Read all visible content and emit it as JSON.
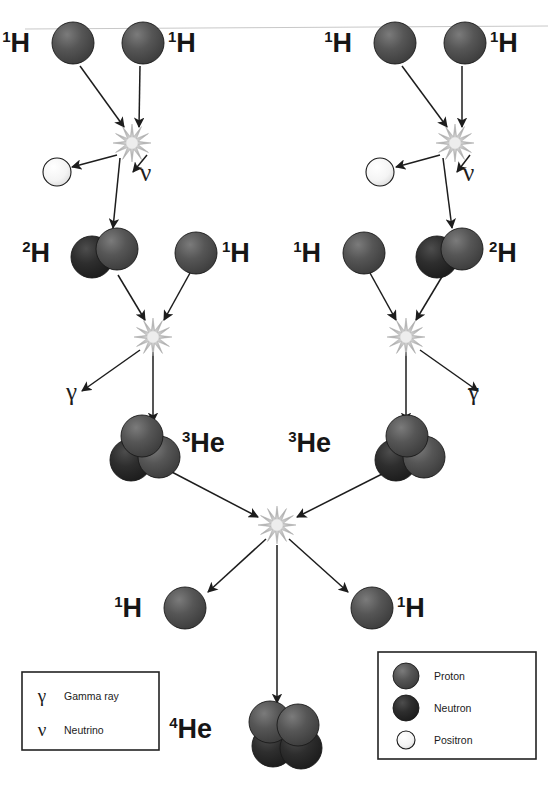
{
  "figure": {
    "background_color": "#ffffff"
  },
  "colors": {
    "proton": "#4a4a4a",
    "proton_highlight": "#6e6e6e",
    "neutron": "#262626",
    "neutron_highlight": "#454545",
    "positron": "#f2f2f2",
    "positron_highlight": "#ffffff",
    "outline": "#1a1a1a",
    "arrow": "#1d1d1d",
    "starburst": "#b9b9b9",
    "text": "#161616"
  },
  "labels": {
    "hydrogen_mass": "1",
    "hydrogen_symbol": "H",
    "deuterium_mass": "2",
    "deuterium_symbol": "H",
    "helium3_mass": "3",
    "helium3_symbol": "He",
    "helium4_mass": "4",
    "helium4_symbol": "He",
    "gamma_symbol": "γ",
    "neutrino_symbol": "ν"
  },
  "nuclei": [
    {
      "id": "h1-top-left-a",
      "label_mass": "1",
      "label_symbol": "H",
      "kind": "proton",
      "cx": 73,
      "cy": 43,
      "label_x": 30,
      "label_y": 52,
      "label_side": "left"
    },
    {
      "id": "h1-top-left-b",
      "label_mass": "1",
      "label_symbol": "H",
      "kind": "proton",
      "cx": 143,
      "cy": 43,
      "label_x": 168,
      "label_y": 52,
      "label_side": "right"
    },
    {
      "id": "h1-top-right-a",
      "label_mass": "1",
      "label_symbol": "H",
      "kind": "proton",
      "cx": 395,
      "cy": 43,
      "label_x": 352,
      "label_y": 52,
      "label_side": "left"
    },
    {
      "id": "h1-top-right-b",
      "label_mass": "1",
      "label_symbol": "H",
      "kind": "proton",
      "cx": 465,
      "cy": 43,
      "label_x": 490,
      "label_y": 52,
      "label_side": "right"
    },
    {
      "id": "d2-left",
      "label_mass": "2",
      "label_symbol": "H",
      "kind": "deuteron",
      "cx": 108,
      "cy": 253,
      "label_x": 50,
      "label_y": 262,
      "label_side": "left"
    },
    {
      "id": "h1-mid-left",
      "label_mass": "1",
      "label_symbol": "H",
      "kind": "proton",
      "cx": 196,
      "cy": 253,
      "label_x": 222,
      "label_y": 262,
      "label_side": "right"
    },
    {
      "id": "h1-mid-right",
      "label_mass": "1",
      "label_symbol": "H",
      "kind": "proton",
      "cx": 364,
      "cy": 253,
      "label_x": 321,
      "label_y": 262,
      "label_side": "left"
    },
    {
      "id": "d2-right",
      "label_mass": "2",
      "label_symbol": "H",
      "kind": "deuteron",
      "cx": 453,
      "cy": 253,
      "label_x": 489,
      "label_y": 262,
      "label_side": "right"
    },
    {
      "id": "he3-left",
      "label_mass": "3",
      "label_symbol": "He",
      "kind": "helium3",
      "cx": 145,
      "cy": 447,
      "label_x": 182,
      "label_y": 452,
      "label_side": "right"
    },
    {
      "id": "he3-right",
      "label_mass": "3",
      "label_symbol": "He",
      "kind": "helium3",
      "cx": 410,
      "cy": 447,
      "label_x": 331,
      "label_y": 452,
      "label_side": "left"
    },
    {
      "id": "h1-out-left",
      "label_mass": "1",
      "label_symbol": "H",
      "kind": "proton",
      "cx": 185,
      "cy": 608,
      "label_x": 142,
      "label_y": 617,
      "label_side": "left"
    },
    {
      "id": "h1-out-right",
      "label_mass": "1",
      "label_symbol": "H",
      "kind": "proton",
      "cx": 372,
      "cy": 608,
      "label_x": 397,
      "label_y": 617,
      "label_side": "right"
    },
    {
      "id": "he4-final",
      "label_mass": "4",
      "label_symbol": "He",
      "kind": "helium4",
      "cx": 290,
      "cy": 733,
      "label_x": 212,
      "label_y": 738,
      "label_side": "left"
    }
  ],
  "positrons": [
    {
      "id": "positron-left",
      "cx": 57,
      "cy": 172
    },
    {
      "id": "positron-right",
      "cx": 380,
      "cy": 172
    }
  ],
  "greek_labels": [
    {
      "id": "neutrino-left",
      "symbol": "ν",
      "x": 140,
      "y": 181
    },
    {
      "id": "neutrino-right",
      "symbol": "ν",
      "x": 463,
      "y": 181
    },
    {
      "id": "gamma-left",
      "symbol": "γ",
      "x": 66,
      "y": 400
    },
    {
      "id": "gamma-right",
      "symbol": "γ",
      "x": 468,
      "y": 400
    }
  ],
  "starbursts": [
    {
      "id": "fusion-1-left",
      "cx": 132,
      "cy": 143,
      "r": 19
    },
    {
      "id": "fusion-1-right",
      "cx": 455,
      "cy": 143,
      "r": 19
    },
    {
      "id": "fusion-2-left",
      "cx": 153,
      "cy": 337,
      "r": 19
    },
    {
      "id": "fusion-2-right",
      "cx": 406,
      "cy": 337,
      "r": 19
    },
    {
      "id": "fusion-final",
      "cx": 277,
      "cy": 525,
      "r": 19
    }
  ],
  "arrows": [
    {
      "id": "arrow-h1-a-to-fusion1-left",
      "x1": 80,
      "y1": 66,
      "x2": 124,
      "y2": 127
    },
    {
      "id": "arrow-h1-b-to-fusion1-left",
      "x1": 140,
      "y1": 66,
      "x2": 139,
      "y2": 127
    },
    {
      "id": "arrow-fusion1-left-to-d2",
      "x1": 120,
      "y1": 158,
      "x2": 113,
      "y2": 228
    },
    {
      "id": "arrow-fusion1-left-to-positron",
      "x1": 117,
      "y1": 155,
      "x2": 72,
      "y2": 167
    },
    {
      "id": "arrow-fusion1-left-to-neutrino",
      "x1": 147,
      "y1": 155,
      "x2": 133,
      "y2": 172
    },
    {
      "id": "arrow-h1-a-to-fusion1-right",
      "x1": 402,
      "y1": 66,
      "x2": 447,
      "y2": 127
    },
    {
      "id": "arrow-h1-b-to-fusion1-right",
      "x1": 462,
      "y1": 66,
      "x2": 462,
      "y2": 127
    },
    {
      "id": "arrow-fusion1-right-to-d2",
      "x1": 443,
      "y1": 158,
      "x2": 452,
      "y2": 228
    },
    {
      "id": "arrow-fusion1-right-to-positron",
      "x1": 440,
      "y1": 155,
      "x2": 396,
      "y2": 167
    },
    {
      "id": "arrow-fusion1-right-to-neutrino",
      "x1": 470,
      "y1": 155,
      "x2": 457,
      "y2": 172
    },
    {
      "id": "arrow-d2-left-to-fusion2",
      "x1": 118,
      "y1": 275,
      "x2": 145,
      "y2": 320
    },
    {
      "id": "arrow-h1-mid-left-to-fusion2",
      "x1": 190,
      "y1": 273,
      "x2": 164,
      "y2": 320
    },
    {
      "id": "arrow-fusion2-left-to-he3",
      "x1": 153,
      "y1": 352,
      "x2": 153,
      "y2": 422
    },
    {
      "id": "arrow-fusion2-left-to-gamma",
      "x1": 140,
      "y1": 350,
      "x2": 82,
      "y2": 391
    },
    {
      "id": "arrow-h1-mid-right-to-fusion2",
      "x1": 370,
      "y1": 273,
      "x2": 396,
      "y2": 320
    },
    {
      "id": "arrow-d2-right-to-fusion2",
      "x1": 443,
      "y1": 275,
      "x2": 416,
      "y2": 320
    },
    {
      "id": "arrow-fusion2-right-to-he3",
      "x1": 406,
      "y1": 352,
      "x2": 406,
      "y2": 422
    },
    {
      "id": "arrow-fusion2-right-to-gamma",
      "x1": 420,
      "y1": 350,
      "x2": 478,
      "y2": 391
    },
    {
      "id": "arrow-he3-left-to-final",
      "x1": 168,
      "y1": 470,
      "x2": 258,
      "y2": 517
    },
    {
      "id": "arrow-he3-right-to-final",
      "x1": 390,
      "y1": 470,
      "x2": 297,
      "y2": 517
    },
    {
      "id": "arrow-final-to-h1-left",
      "x1": 266,
      "y1": 539,
      "x2": 208,
      "y2": 592
    },
    {
      "id": "arrow-final-to-h1-right",
      "x1": 289,
      "y1": 539,
      "x2": 348,
      "y2": 592
    },
    {
      "id": "arrow-final-to-he4",
      "x1": 277,
      "y1": 545,
      "x2": 277,
      "y2": 703
    }
  ],
  "symbol_legend": {
    "id": "symbol-legend",
    "box": {
      "x": 22,
      "y": 672,
      "width": 137,
      "height": 78
    },
    "items": [
      {
        "symbol": "γ",
        "label": "Gamma ray"
      },
      {
        "symbol": "ν",
        "label": "Neutrino"
      }
    ]
  },
  "particle_legend": {
    "id": "particle-legend",
    "box": {
      "x": 378,
      "y": 652,
      "width": 158,
      "height": 107
    },
    "items": [
      {
        "kind": "proton",
        "label": "Proton"
      },
      {
        "kind": "neutron",
        "label": "Neutron"
      },
      {
        "kind": "positron",
        "label": "Positron"
      }
    ]
  }
}
